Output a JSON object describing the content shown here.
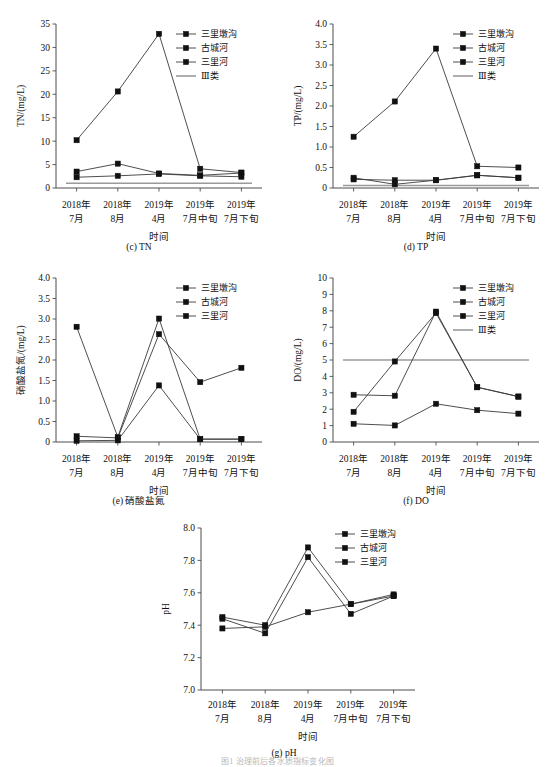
{
  "figure": {
    "caption": "图1 治理前后各水质指标变化图",
    "x_categories": [
      "2018年\n7月",
      "2018年\n8月",
      "2019年\n4月",
      "2019年\n7月中旬",
      "2019年\n7月下旬"
    ],
    "x_axis_title": "时间",
    "series_names": [
      "三里墩沟",
      "古城河",
      "三里河"
    ],
    "reference_label": "Ⅲ类"
  },
  "chart_data": [
    {
      "id": "tn",
      "type": "line",
      "title": "(c) TN",
      "ylabel": "TN/(mg/L)",
      "xlabel": "时间",
      "categories": [
        "2018年7月",
        "2018年8月",
        "2019年4月",
        "2019年7月中旬",
        "2019年7月下旬"
      ],
      "ylim": [
        0,
        35
      ],
      "yticks": [
        0,
        5,
        10,
        15,
        20,
        25,
        30,
        35
      ],
      "ytick_labels": [
        "0",
        "5",
        "10",
        "15",
        "20",
        "25",
        "30",
        "35"
      ],
      "grid": false,
      "legend_position": "top-right",
      "series": [
        {
          "name": "三里墩沟",
          "values": [
            10.2,
            20.6,
            32.9,
            4.1,
            3.3
          ]
        },
        {
          "name": "古城河",
          "values": [
            3.5,
            5.2,
            3.1,
            2.7,
            3.2
          ]
        },
        {
          "name": "三里河",
          "values": [
            2.3,
            2.6,
            3.0,
            2.6,
            2.4
          ]
        }
      ],
      "reference_line": {
        "label": "Ⅲ类",
        "value": 1.0
      }
    },
    {
      "id": "tp",
      "type": "line",
      "title": "(d) TP",
      "ylabel": "TP/(mg/L)",
      "xlabel": "时间",
      "categories": [
        "2018年7月",
        "2018年8月",
        "2019年4月",
        "2019年7月中旬",
        "2019年7月下旬"
      ],
      "ylim": [
        0,
        4.0
      ],
      "yticks": [
        0,
        0.5,
        1.0,
        1.5,
        2.0,
        2.5,
        3.0,
        3.5,
        4.0
      ],
      "ytick_labels": [
        "0",
        "0.5",
        "1.0",
        "1.5",
        "2.0",
        "2.5",
        "3.0",
        "3.5",
        "4.0"
      ],
      "grid": false,
      "legend_position": "top-right",
      "series": [
        {
          "name": "三里墩沟",
          "values": [
            1.25,
            2.11,
            3.4,
            0.53,
            0.5
          ]
        },
        {
          "name": "古城河",
          "values": [
            0.21,
            0.19,
            0.19,
            0.31,
            0.25
          ]
        },
        {
          "name": "三里河",
          "values": [
            0.25,
            0.09,
            0.19,
            0.31,
            0.25
          ]
        }
      ],
      "reference_line": {
        "label": "Ⅲ类",
        "value": 0.06
      }
    },
    {
      "id": "nitrate",
      "type": "line",
      "title": "(e) 硝酸盐氮",
      "ylabel": "硝酸盐氮/(mg/L)",
      "xlabel": "时间",
      "categories": [
        "2018年7月",
        "2018年8月",
        "2019年4月",
        "2019年7月中旬",
        "2019年7月下旬"
      ],
      "ylim": [
        0,
        4.0
      ],
      "yticks": [
        0,
        0.5,
        1.0,
        1.5,
        2.0,
        2.5,
        3.0,
        3.5,
        4.0
      ],
      "ytick_labels": [
        "0",
        "0.5",
        "1.0",
        "1.5",
        "2.0",
        "2.5",
        "3.0",
        "3.5",
        "4.0"
      ],
      "grid": false,
      "legend_position": "top-right",
      "series": [
        {
          "name": "三里墩沟",
          "values": [
            2.81,
            0.12,
            3.01,
            0.07,
            0.07
          ]
        },
        {
          "name": "古城河",
          "values": [
            0.14,
            0.1,
            2.63,
            1.46,
            1.81
          ]
        },
        {
          "name": "三里河",
          "values": [
            0.03,
            0.04,
            1.38,
            0.07,
            0.07
          ]
        }
      ],
      "reference_line": null
    },
    {
      "id": "do",
      "type": "line",
      "title": "(f) DO",
      "ylabel": "DO/(mg/L)",
      "xlabel": "时间",
      "categories": [
        "2018年7月",
        "2018年8月",
        "2019年4月",
        "2019年7月中旬",
        "2019年7月下旬"
      ],
      "ylim": [
        0,
        10
      ],
      "yticks": [
        0,
        1,
        2,
        3,
        4,
        5,
        6,
        7,
        8,
        9,
        10
      ],
      "ytick_labels": [
        "0",
        "1",
        "2",
        "3",
        "4",
        "5",
        "6",
        "7",
        "8",
        "9",
        "10"
      ],
      "grid": false,
      "legend_position": "top-right",
      "series": [
        {
          "name": "三里墩沟",
          "values": [
            2.88,
            2.82,
            7.95,
            3.34,
            2.77
          ]
        },
        {
          "name": "古城河",
          "values": [
            1.84,
            4.91,
            7.86,
            3.34,
            2.77
          ]
        },
        {
          "name": "三里河",
          "values": [
            1.11,
            1.01,
            2.33,
            1.94,
            1.73
          ]
        }
      ],
      "reference_line": {
        "label": "Ⅲ类",
        "value": 5.0
      }
    },
    {
      "id": "ph",
      "type": "line",
      "title": "(g) pH",
      "ylabel": "pH",
      "xlabel": "时间",
      "categories": [
        "2018年7月",
        "2018年8月",
        "2019年4月",
        "2019年7月中旬",
        "2019年7月下旬"
      ],
      "ylim": [
        7.0,
        8.0
      ],
      "yticks": [
        7.0,
        7.2,
        7.4,
        7.6,
        7.8,
        8.0
      ],
      "ytick_labels": [
        "7.0",
        "7.2",
        "7.4",
        "7.6",
        "7.8",
        "8.0"
      ],
      "grid": false,
      "legend_position": "top-right",
      "series": [
        {
          "name": "三里墩沟",
          "values": [
            7.45,
            7.4,
            7.88,
            7.53,
            7.59
          ]
        },
        {
          "name": "古城河",
          "values": [
            7.44,
            7.35,
            7.82,
            7.47,
            7.58
          ]
        },
        {
          "name": "三里河",
          "values": [
            7.38,
            7.39,
            7.48,
            7.53,
            7.58
          ]
        }
      ],
      "reference_line": null
    }
  ]
}
